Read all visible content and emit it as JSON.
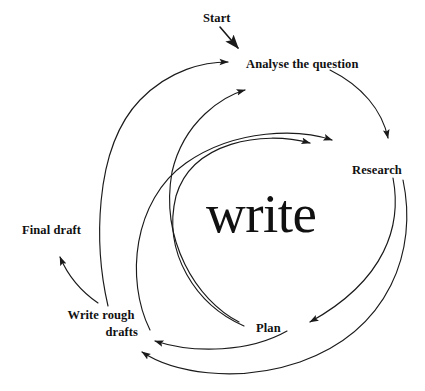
{
  "diagram": {
    "title": "write",
    "type": "cyclical process flow diagram",
    "center_word": "write",
    "nodes": [
      {
        "id": "start",
        "label": "Start"
      },
      {
        "id": "analyse",
        "label": "Analyse the question"
      },
      {
        "id": "research",
        "label": "Research"
      },
      {
        "id": "plan",
        "label": "Plan"
      },
      {
        "id": "write_rough",
        "label": "Write rough"
      },
      {
        "id": "drafts",
        "label": "drafts"
      },
      {
        "id": "final_draft",
        "label": "Final draft"
      }
    ],
    "edges": [
      {
        "from": "start",
        "to": "analyse",
        "style": "short-straight-arrow"
      },
      {
        "from": "analyse",
        "to": "research",
        "style": "outer-arc-clockwise"
      },
      {
        "from": "research",
        "to": "plan",
        "style": "outer-arc-clockwise"
      },
      {
        "from": "plan",
        "to": "drafts",
        "style": "arc-leftward"
      },
      {
        "from": "research",
        "to": "drafts",
        "style": "wide-bottom-arc-leftward"
      },
      {
        "from": "drafts",
        "to": "analyse",
        "style": "outer-arc-counterclockwise"
      },
      {
        "from": "plan",
        "to": "analyse",
        "style": "inner-arc-upward"
      },
      {
        "from": "plan",
        "to": "research",
        "style": "inner-arc-rightward"
      },
      {
        "from": "drafts",
        "to": "research",
        "style": "inner-arc-rightward"
      },
      {
        "from": "write_rough",
        "to": "final_draft",
        "style": "short-arc-upleft"
      }
    ],
    "colors": {
      "stroke": "#1a1a1a",
      "text": "#111111",
      "background": "#ffffff"
    }
  }
}
